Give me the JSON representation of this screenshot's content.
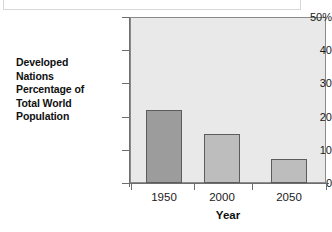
{
  "chart_data": {
    "type": "bar",
    "title": "",
    "categories": [
      "1950",
      "2000",
      "2050"
    ],
    "values": [
      22,
      14.8,
      7.2
    ],
    "series": [
      {
        "name": "Developed Nations Percentage of Total World Population",
        "values": [
          22,
          14.8,
          7.2
        ]
      }
    ],
    "xlabel": "Year",
    "ylabel": "Developed Nations Percentage of Total World Population",
    "ylim": [
      0,
      50
    ],
    "yticks": [
      0,
      10,
      20,
      30,
      40,
      50
    ],
    "ytick_labels": [
      "0",
      "10",
      "20",
      "30",
      "40",
      "50%"
    ],
    "xtick_labels": [
      "1950",
      "2000",
      "2050"
    ],
    "grid": false,
    "legend": false,
    "legend_position": "none",
    "units": "percent",
    "bar_colors": [
      "#9c9c9c",
      "#bdbdbd",
      "#bdbdbd"
    ],
    "plot_background": "#e9e9e9",
    "axis_color": "#6e6e6e",
    "bar_border_color": "#5c5c5c"
  },
  "axis_label_lines": [
    "Developed",
    "Nations",
    "Percentage of",
    "Total World",
    "Population"
  ],
  "y_ticks": [
    {
      "label": "50%",
      "value": 50
    },
    {
      "label": "40",
      "value": 40
    },
    {
      "label": "30",
      "value": 30
    },
    {
      "label": "20",
      "value": 20
    },
    {
      "label": "10",
      "value": 10
    },
    {
      "label": "0",
      "value": 0
    }
  ],
  "x_ticks": [
    {
      "label": "1950",
      "value": 22
    },
    {
      "label": "2000",
      "value": 14.8
    },
    {
      "label": "2050",
      "value": 7.2
    }
  ],
  "x_axis_title": "Year"
}
